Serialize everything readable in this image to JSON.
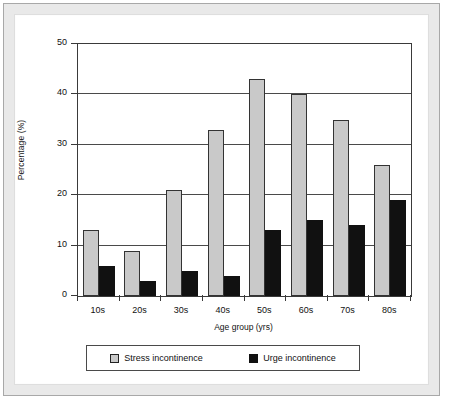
{
  "chart_data": {
    "type": "bar",
    "title": "",
    "xlabel": "Age group (yrs)",
    "ylabel": "Percentage (%)",
    "categories": [
      "10s",
      "20s",
      "30s",
      "40s",
      "50s",
      "60s",
      "70s",
      "80s"
    ],
    "series": [
      {
        "name": "Stress incontinence",
        "color": "#c9c9c9",
        "values": [
          13,
          9,
          21,
          33,
          43,
          40,
          35,
          26
        ]
      },
      {
        "name": "Urge incontinence",
        "color": "#111111",
        "values": [
          6,
          3,
          5,
          4,
          13,
          15,
          14,
          19
        ]
      }
    ],
    "ylim": [
      0,
      50
    ],
    "yticks": [
      0,
      10,
      20,
      30,
      40,
      50
    ],
    "grid": "horizontal",
    "legend_position": "bottom"
  },
  "legend": {
    "entries": [
      {
        "label": "Stress incontinence",
        "swatch": "stress"
      },
      {
        "label": "Urge incontinence",
        "swatch": "urge"
      }
    ]
  }
}
